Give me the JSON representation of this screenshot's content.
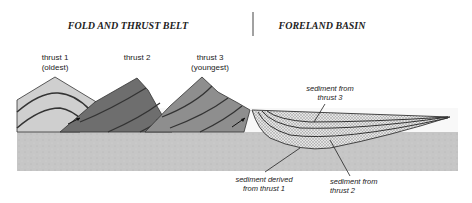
{
  "headers": {
    "left": "FOLD AND THRUST BELT",
    "right": "FORELAND BASIN"
  },
  "thrust_labels": [
    {
      "line1": "thrust 1",
      "line2": "(oldest)"
    },
    {
      "line1": "thrust 2",
      "line2": ""
    },
    {
      "line1": "thrust 3",
      "line2": "(youngest)"
    }
  ],
  "sediment_labels": {
    "thrust3": {
      "line1": "sediment from",
      "line2": "thrust 3"
    },
    "thrust1": {
      "line1": "sediment derived",
      "line2": "from thrust 1"
    },
    "thrust2": {
      "line1": "sediment from",
      "line2": "thrust 2"
    }
  },
  "colors": {
    "thrust1": "#c9c9c9",
    "thrust2": "#6f6f6f",
    "thrust3": "#8f8f8f",
    "basement": "#c4c4c4",
    "sediment": "#d8d8d8",
    "line": "#333333"
  }
}
